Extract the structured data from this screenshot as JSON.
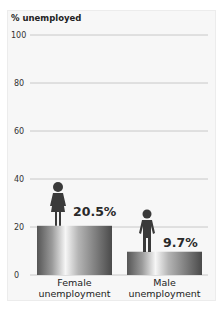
{
  "chart_data": {
    "type": "bar",
    "title": "",
    "ylabel": "% unemployed",
    "xlabel": "",
    "ylim": [
      0,
      100
    ],
    "yticks": [
      0,
      20,
      40,
      60,
      80,
      100
    ],
    "grid": true,
    "categories": [
      "Female\nunemployment",
      "Male\nunemployment"
    ],
    "category_lines": [
      [
        "Female",
        "unemployment"
      ],
      [
        "Male",
        "unemployment"
      ]
    ],
    "values": [
      20.5,
      9.7
    ],
    "data_labels": [
      "20.5%",
      "9.7%"
    ],
    "icons": [
      "female-figure-icon",
      "male-figure-icon"
    ],
    "bar_colors": {
      "edge": "#5a5a5a",
      "highlight": "#f4f4f4"
    }
  }
}
